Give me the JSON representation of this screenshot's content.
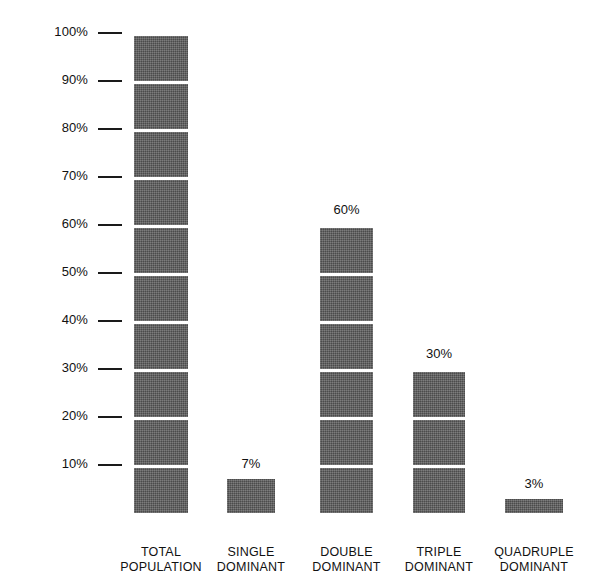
{
  "chart_data": {
    "type": "bar",
    "title": "",
    "subtitle": "",
    "xlabel": "",
    "ylabel": "",
    "ylim": [
      0,
      100
    ],
    "grid": false,
    "legend": null,
    "units": "%",
    "segment_size": 10,
    "categories": [
      "TOTAL POPULATION",
      "SINGLE DOMINANT",
      "DOUBLE DOMINANT",
      "TRIPLE DOMINANT",
      "QUADRUPLE DOMINANT"
    ],
    "values": [
      100,
      7,
      60,
      30,
      3
    ],
    "y_ticks": [
      100,
      90,
      80,
      70,
      60,
      50,
      40,
      30,
      20,
      10
    ],
    "y_tick_labels": [
      "100%",
      "90%",
      "80%",
      "70%",
      "60%",
      "50%",
      "40%",
      "30%",
      "20%",
      "10%"
    ],
    "bar_color": "#5d5d5d",
    "text_color": "#111111",
    "background": "#ffffff"
  },
  "bars": [
    {
      "value": 100,
      "value_label": "100%",
      "show_value_label": false,
      "segments": 10,
      "partial_segment": 0,
      "label_line1": "TOTAL",
      "label_line2": "POPULATION"
    },
    {
      "value": 7,
      "value_label": "7%",
      "show_value_label": true,
      "segments": 0,
      "partial_segment": 7,
      "label_line1": "SINGLE",
      "label_line2": "DOMINANT"
    },
    {
      "value": 60,
      "value_label": "60%",
      "show_value_label": true,
      "segments": 6,
      "partial_segment": 0,
      "label_line1": "DOUBLE",
      "label_line2": "DOMINANT"
    },
    {
      "value": 30,
      "value_label": "30%",
      "show_value_label": true,
      "segments": 3,
      "partial_segment": 0,
      "label_line1": "TRIPLE",
      "label_line2": "DOMINANT"
    },
    {
      "value": 3,
      "value_label": "3%",
      "show_value_label": true,
      "segments": 0,
      "partial_segment": 3,
      "label_line1": "QUADRUPLE",
      "label_line2": "DOMINANT"
    }
  ],
  "axis": {
    "ticks": [
      {
        "label": "100%",
        "value": 100
      },
      {
        "label": "90%",
        "value": 90
      },
      {
        "label": "80%",
        "value": 80
      },
      {
        "label": "70%",
        "value": 70
      },
      {
        "label": "60%",
        "value": 60
      },
      {
        "label": "50%",
        "value": 50
      },
      {
        "label": "40%",
        "value": 40
      },
      {
        "label": "30%",
        "value": 30
      },
      {
        "label": "20%",
        "value": 20
      },
      {
        "label": "10%",
        "value": 10
      }
    ]
  }
}
